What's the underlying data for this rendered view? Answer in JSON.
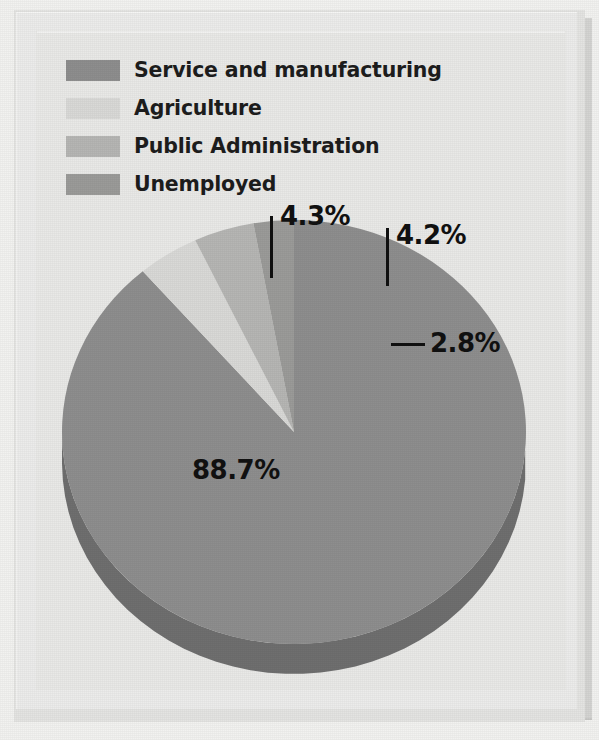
{
  "figure": {
    "background_color": "#e9e9e7",
    "frame_color": "#ececeb"
  },
  "legend": {
    "items": [
      {
        "label": "Service and manufacturing",
        "color": "#8e8e8e",
        "swatch_name": "legend-swatch-service-and-manufacturing"
      },
      {
        "label": "Agriculture",
        "color": "#d9d9d7",
        "swatch_name": "legend-swatch-agriculture"
      },
      {
        "label": "Public Administration",
        "color": "#b6b6b4",
        "swatch_name": "legend-swatch-public-administration"
      },
      {
        "label": "Unemployed",
        "color": "#9b9b99",
        "swatch_name": "legend-swatch-unemployed"
      }
    ]
  },
  "labels": {
    "service": "88.7%",
    "agriculture": "4.3%",
    "public_administration": "4.2%",
    "unemployed": "2.8%"
  },
  "chart_data": {
    "type": "pie",
    "title": "",
    "subtitle": "",
    "xlabel": "",
    "ylabel": "",
    "grid": false,
    "legend_position": "top-left",
    "value_unit": "percent",
    "categories": [
      "Service and manufacturing",
      "Agriculture",
      "Public Administration",
      "Unemployed"
    ],
    "values": [
      88.7,
      4.3,
      4.2,
      2.8
    ],
    "value_labels": [
      "88.7%",
      "4.3%",
      "4.2%",
      "2.8%"
    ],
    "colors": [
      "#8e8e8e",
      "#d9d9d7",
      "#b6b6b4",
      "#9b9b99"
    ],
    "slice_side_colors": [
      "#6f6f6f",
      "#b3b3b1",
      "#949492",
      "#7c7c7a"
    ],
    "start_angle_deg": 270,
    "direction": "clockwise",
    "total": 100.0,
    "three_d": true,
    "annotations": [
      {
        "text": "88.7%",
        "category": "Service and manufacturing",
        "leader": "none"
      },
      {
        "text": "4.3%",
        "category": "Agriculture",
        "leader": "vertical"
      },
      {
        "text": "4.2%",
        "category": "Public Administration",
        "leader": "vertical"
      },
      {
        "text": "2.8%",
        "category": "Unemployed",
        "leader": "horizontal"
      }
    ]
  }
}
